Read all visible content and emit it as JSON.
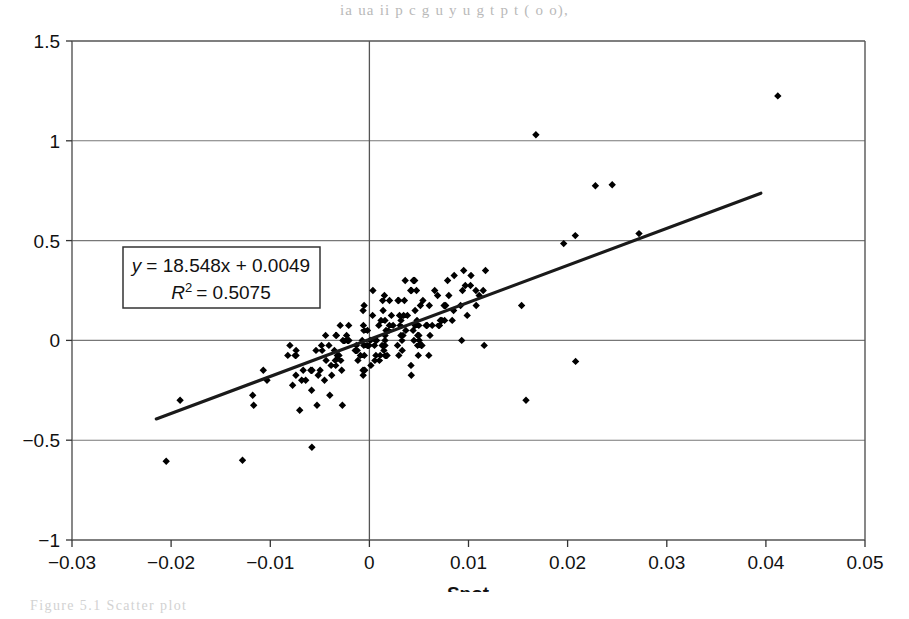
{
  "page": {
    "bleed_top_text": "ia  ua  ii  p    c  g   u y  u  g   t p       t    (     o        o),",
    "bleed_bottom_text": "Figure   5.1        Scatter plot"
  },
  "chart_data": {
    "type": "scatter",
    "title": "",
    "xlabel": "Spot",
    "ylabel": "",
    "xlim": [
      -0.03,
      0.05
    ],
    "ylim": [
      -1,
      1.5
    ],
    "xticks": [
      "−0.03",
      "−0.02",
      "−0.01",
      "0",
      "0.01",
      "0.02",
      "0.03",
      "0.04",
      "0.05"
    ],
    "xtick_values": [
      -0.03,
      -0.02,
      -0.01,
      0,
      0.01,
      0.02,
      0.03,
      0.04,
      0.05
    ],
    "yticks": [
      "−1",
      "−0.5",
      "0",
      "0.5",
      "1",
      "1.5"
    ],
    "ytick_values": [
      -1,
      -0.5,
      0,
      0.5,
      1,
      1.5
    ],
    "grid": "horizontal-gridlines-and-zero-vertical-line",
    "legend": "none",
    "marker": "filled-diamond",
    "marker_color": "#000000",
    "trendline": {
      "type": "linear",
      "slope": 18.548,
      "intercept": 0.0049,
      "r_squared": 0.5075,
      "x_start": -0.0215,
      "x_end": 0.0395,
      "color": "#1a1a1a"
    },
    "annotation": {
      "equation": "y = 18.548x + 0.0049",
      "equation_lhs": "y",
      "equation_rhs": "= 18.548x + 0.0049",
      "r2_symbol": "R",
      "r2_exponent": "2",
      "r2_value": "= 0.5075",
      "box_border_color": "#333333",
      "box_fill": "#ffffff"
    },
    "n_points": 842,
    "points_note": "Values are banded at discrete y levels of about 0.025; dense core between x=-0.005 and x=0.012.",
    "outliers": [
      {
        "x": 0.0412,
        "y": 1.225
      },
      {
        "x": 0.0168,
        "y": 1.03
      },
      {
        "x": 0.0228,
        "y": 0.775
      },
      {
        "x": 0.0245,
        "y": 0.78
      },
      {
        "x": 0.0272,
        "y": 0.535
      },
      {
        "x": 0.0196,
        "y": 0.485
      },
      {
        "x": 0.0208,
        "y": -0.105
      },
      {
        "x": 0.0158,
        "y": -0.3
      },
      {
        "x": -0.0205,
        "y": -0.605
      },
      {
        "x": -0.0128,
        "y": -0.6
      },
      {
        "x": -0.0058,
        "y": -0.535
      }
    ]
  }
}
